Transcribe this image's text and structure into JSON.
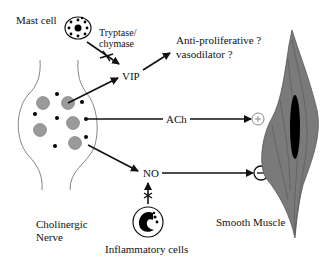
{
  "labels": {
    "mast_cell": "Mast cell",
    "enzyme_line1": "Tryptase/",
    "enzyme_line2": "chymase",
    "vip": "VIP",
    "effect_line1": "Anti-proliferative ?",
    "effect_line2": "vasodilator ?",
    "ach": "ACh",
    "no": "NO",
    "nerve_line1": "Cholinergic",
    "nerve_line2": "Nerve",
    "muscle": "Smooth Muscle",
    "inflammatory": "Inflammatory cells"
  },
  "symbols": {
    "plus": "+",
    "minus": "−"
  },
  "colors": {
    "line": "#111111",
    "vesicle_fill": "#9a9a9a",
    "muscle_fill": "#7a7a7a",
    "nucleus": "#000000"
  }
}
